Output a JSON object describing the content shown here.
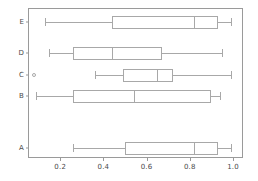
{
  "chart_data": {
    "type": "box",
    "orientation": "horizontal",
    "title": "",
    "xlabel": "",
    "ylabel": "",
    "xlim": [
      0.0,
      1.05
    ],
    "grid": false,
    "legend": null,
    "xticks": [
      {
        "value": 0.2,
        "label": "0.2"
      },
      {
        "value": 0.4,
        "label": "0.4"
      },
      {
        "value": 0.6,
        "label": "0.6"
      },
      {
        "value": 0.8,
        "label": "0.8"
      },
      {
        "value": 1.0,
        "label": "1.0"
      }
    ],
    "categories": [
      "A",
      "B",
      "C",
      "D",
      "E"
    ],
    "boxes": [
      {
        "label": "E",
        "y_px": 22,
        "whisker_low": 0.13,
        "q1": 0.44,
        "median": 0.82,
        "q3": 0.93,
        "whisker_high": 0.99,
        "outliers": []
      },
      {
        "label": "D",
        "y_px": 53,
        "whisker_low": 0.15,
        "q1": 0.26,
        "median": 0.44,
        "q3": 0.67,
        "whisker_high": 0.95,
        "outliers": []
      },
      {
        "label": "C",
        "y_px": 75,
        "whisker_low": 0.36,
        "q1": 0.49,
        "median": 0.65,
        "q3": 0.72,
        "whisker_high": 0.99,
        "outliers": [
          0.08
        ]
      },
      {
        "label": "B",
        "y_px": 96,
        "whisker_low": 0.09,
        "q1": 0.26,
        "median": 0.54,
        "q3": 0.9,
        "whisker_high": 0.94,
        "outliers": []
      },
      {
        "label": "A",
        "y_px": 148,
        "whisker_low": 0.26,
        "q1": 0.5,
        "median": 0.82,
        "q3": 0.93,
        "whisker_high": 0.99,
        "outliers": []
      }
    ],
    "colors": {
      "frame": "#9a9a9a",
      "box_edge": "#a8a8a8",
      "median": "#a8a8a8",
      "whisker": "#a8a8a8",
      "outlier": "#a8a8a8",
      "tick_text": "#4a4a4a",
      "background": "#ffffff"
    },
    "geometry": {
      "frame_left": 28,
      "frame_right": 243,
      "frame_top": 8,
      "frame_bottom": 158,
      "x_at_zero": 17.0,
      "px_per_unit": 216.0,
      "box_height": 13
    }
  }
}
